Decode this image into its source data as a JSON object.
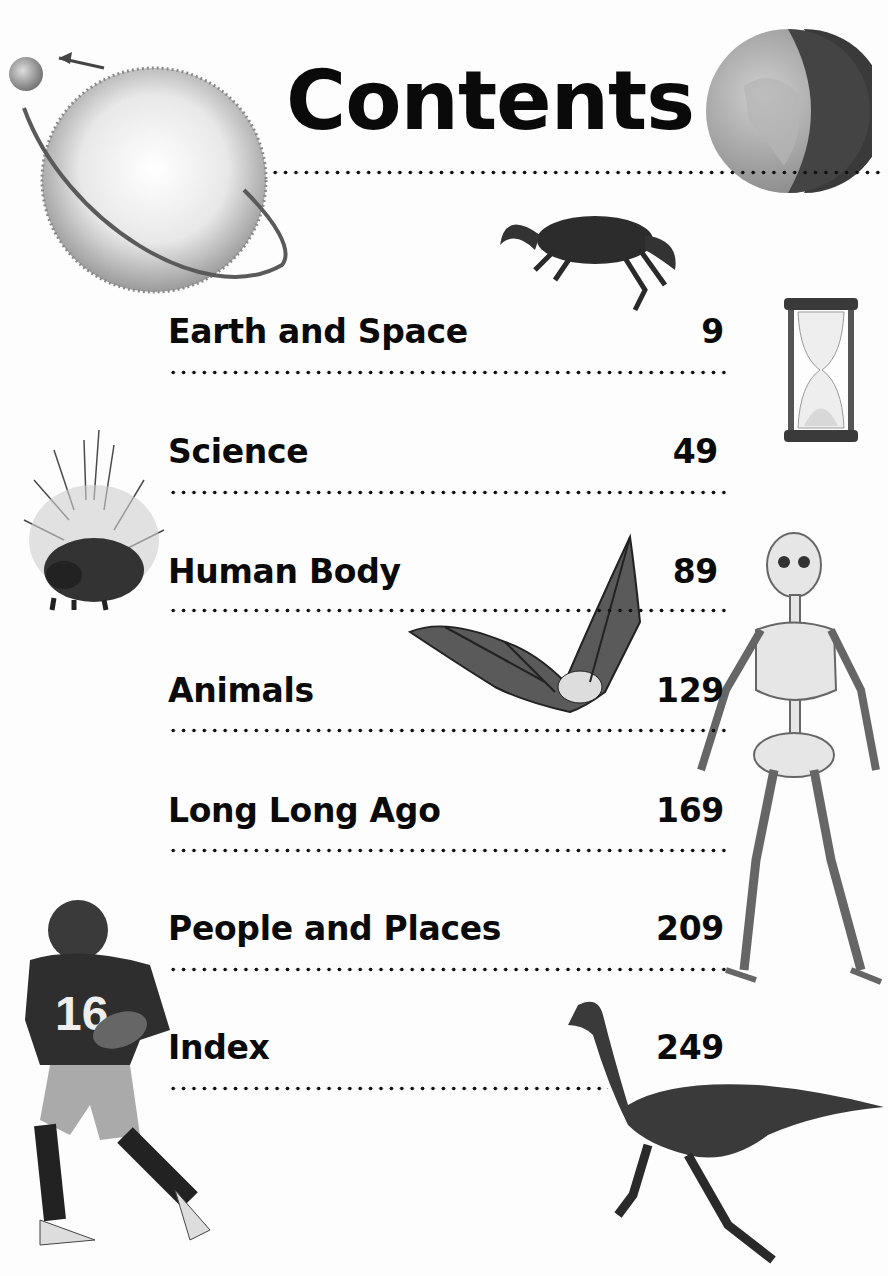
{
  "page": {
    "title": "Contents",
    "entries": [
      {
        "label": "Earth and Space",
        "page": "9"
      },
      {
        "label": "Science",
        "page": "49"
      },
      {
        "label": "Human Body",
        "page": "89"
      },
      {
        "label": "Animals",
        "page": "129"
      },
      {
        "label": "Long Long Ago",
        "page": "169"
      },
      {
        "label": "People and Places",
        "page": "209"
      },
      {
        "label": "Index",
        "page": "249"
      }
    ],
    "illustrations": [
      "sun-illustration",
      "earth-globe-illustration",
      "crab-illustration",
      "hourglass-illustration",
      "porcupine-illustration",
      "bat-illustration",
      "skeleton-illustration",
      "football-player-illustration",
      "dinosaur-illustration"
    ],
    "jersey_number": "16"
  }
}
